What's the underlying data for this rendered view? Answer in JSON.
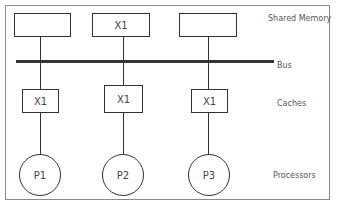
{
  "diagram": {
    "memory": [
      {
        "label": ""
      },
      {
        "label": "X1"
      },
      {
        "label": ""
      }
    ],
    "caches": [
      {
        "label": "X1"
      },
      {
        "label": "X1"
      },
      {
        "label": "X1"
      }
    ],
    "processors": [
      {
        "label": "P1"
      },
      {
        "label": "P2"
      },
      {
        "label": "P3"
      }
    ],
    "row_labels": {
      "memory": "Shared Memory",
      "bus": "Bus",
      "caches": "Caches",
      "processors": "Processors"
    }
  }
}
